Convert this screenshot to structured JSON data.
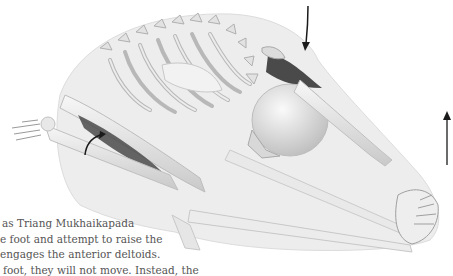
{
  "figure": {
    "highlighted_muscles": [
      "anterior-deltoid",
      "forearm-flexor"
    ],
    "arrows": [
      {
        "name": "down-arrow-shoulder",
        "direction": "down"
      },
      {
        "name": "up-arrow-hands",
        "direction": "up"
      },
      {
        "name": "curved-arrow-forearm",
        "direction": "rotate"
      }
    ],
    "colors": {
      "bone": "#e6e6e6",
      "bone_shadow": "#b5b5b5",
      "muscle_highlight": "#4a4a4a",
      "body_silhouette": "#ececec",
      "arrow": "#1a1a1a"
    }
  },
  "caption": {
    "lines": [
      "as Triang Mukhaikapada",
      "e foot and attempt to raise the",
      "engages the anterior deltoids.",
      "foot, they will not move. Instead, the"
    ]
  }
}
